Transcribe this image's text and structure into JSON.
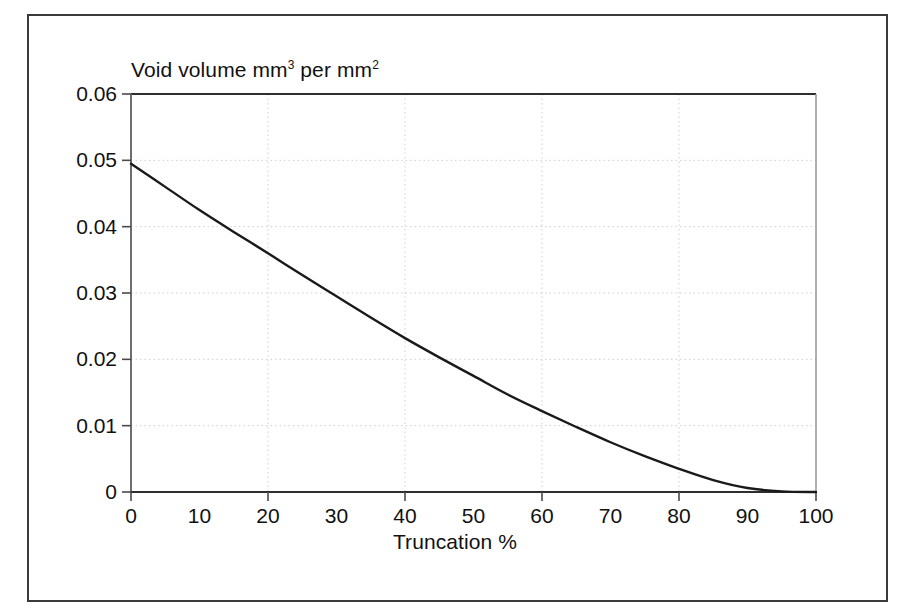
{
  "figure": {
    "frame": true,
    "background": "#ffffff"
  },
  "chart_data": {
    "type": "line",
    "title": "",
    "ylabel_html": "Void volume mm3 per mm2",
    "ylabel_main": "Void volume mm",
    "ylabel_sup1": "3",
    "ylabel_mid": " per mm",
    "ylabel_sup2": "2",
    "xlabel": "Truncation %",
    "xlim": [
      0,
      100
    ],
    "ylim": [
      0,
      0.06
    ],
    "xticks": [
      0,
      10,
      20,
      30,
      40,
      50,
      60,
      70,
      80,
      90,
      100
    ],
    "xtick_labels": [
      "0",
      "10",
      "20",
      "30",
      "40",
      "50",
      "60",
      "70",
      "80",
      "90",
      "100"
    ],
    "yticks": [
      0,
      0.01,
      0.02,
      0.03,
      0.04,
      0.05,
      0.06
    ],
    "ytick_labels": [
      "0",
      "0.01",
      "0.02",
      "0.03",
      "0.04",
      "0.05",
      "0.06"
    ],
    "grid": true,
    "grid_style": "dotted",
    "grid_color": "#cfcfcf",
    "grid_x": [
      20,
      40,
      60,
      80
    ],
    "grid_y": [
      0.01,
      0.02,
      0.03,
      0.04,
      0.05
    ],
    "legend": null,
    "line_color": "#1a1a1a",
    "line_width": 2.4,
    "x": [
      0,
      5,
      10,
      15,
      20,
      25,
      30,
      35,
      40,
      45,
      50,
      55,
      60,
      65,
      70,
      75,
      80,
      85,
      90,
      95,
      100
    ],
    "y": [
      0.0495,
      0.046,
      0.0425,
      0.0392,
      0.036,
      0.0327,
      0.0295,
      0.0263,
      0.0232,
      0.0203,
      0.0175,
      0.0147,
      0.0122,
      0.0098,
      0.0075,
      0.0054,
      0.0035,
      0.0018,
      0.0006,
      0.0001,
      0.0
    ],
    "series": [
      {
        "name": "Void volume",
        "values": [
          0.0495,
          0.046,
          0.0425,
          0.0392,
          0.036,
          0.0327,
          0.0295,
          0.0263,
          0.0232,
          0.0203,
          0.0175,
          0.0147,
          0.0122,
          0.0098,
          0.0075,
          0.0054,
          0.0035,
          0.0018,
          0.0006,
          0.0001,
          0.0
        ]
      }
    ]
  }
}
